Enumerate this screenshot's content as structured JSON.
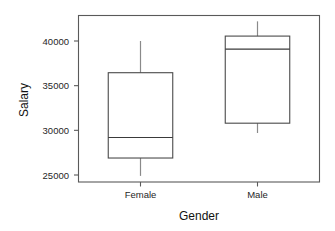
{
  "chart_data": {
    "type": "box",
    "title": "",
    "xlabel": "Gender",
    "ylabel": "Salary",
    "categories": [
      "Female",
      "Male"
    ],
    "ytick_labels": [
      "25000",
      "30000",
      "35000",
      "40000"
    ],
    "ytick_values": [
      25000,
      30000,
      35000,
      40000
    ],
    "ylim": [
      23900,
      43200
    ],
    "grid": false,
    "legend": "none",
    "boxes": [
      {
        "category": "Female",
        "whisker_low": 24900,
        "q1": 26900,
        "median": 29200,
        "q3": 36450,
        "whisker_high": 40000
      },
      {
        "category": "Male",
        "whisker_low": 29700,
        "q1": 30800,
        "median": 39100,
        "q3": 40550,
        "whisker_high": 42200
      }
    ],
    "colors": {
      "box_stroke": "#4a4a4a",
      "median_stroke": "#3a3a3a",
      "whisker_stroke": "#8a8a8a",
      "axis_stroke": "#5a5a5a",
      "background": "#ffffff",
      "text": "#262626"
    }
  }
}
